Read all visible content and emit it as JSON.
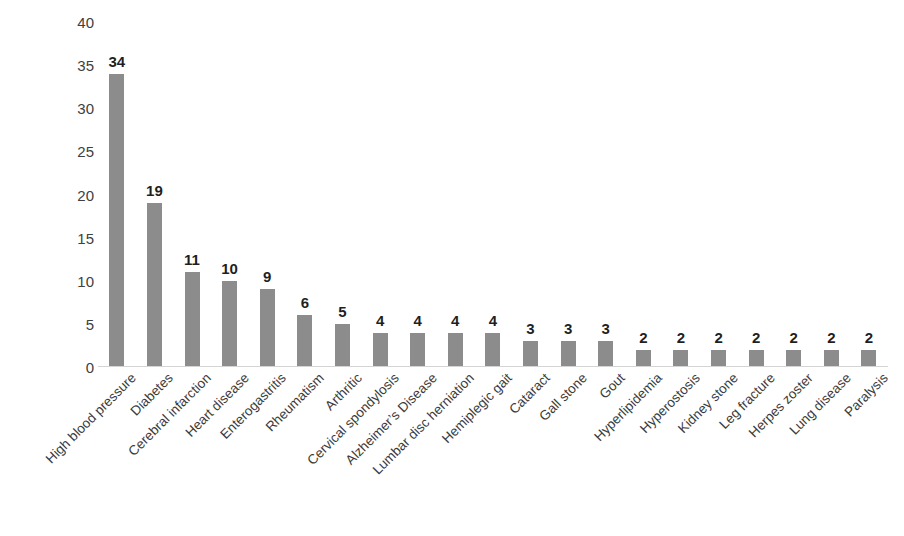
{
  "chart_data": {
    "type": "bar",
    "title": "",
    "subtitle": "",
    "xlabel": "",
    "ylabel": "Number of suffer ng elderly people",
    "ylim": [
      0,
      40
    ],
    "ytick_step": 5,
    "yticks": [
      "0",
      "5",
      "10",
      "15",
      "20",
      "25",
      "30",
      "35",
      "40"
    ],
    "grid": false,
    "legend": false,
    "legend_position": "none",
    "bar_color": "#8c8c8c",
    "show_value_labels": true,
    "categories": [
      "High blood pressure",
      "Diabetes",
      "Cerebral infarction",
      "Heart disease",
      "Enterogastritis",
      "Rheumatism",
      "Arthritic",
      "Cervical spondylosis",
      "Alzheimer’s Disease",
      "Lumbar disc herniation",
      "Hemiplegic gait",
      "Cataract",
      "Gall stone",
      "Gout",
      "Hyperlipidemia",
      "Hyperostosis",
      "Kidney stone",
      "Leg fracture",
      "Herpes zoster",
      "Lung disease",
      "Paralysis"
    ],
    "values": [
      34,
      19,
      11,
      10,
      9,
      6,
      5,
      4,
      4,
      4,
      4,
      3,
      3,
      3,
      2,
      2,
      2,
      2,
      2,
      2,
      2
    ],
    "value_labels": [
      "34",
      "19",
      "11",
      "10",
      "9",
      "6",
      "5",
      "4",
      "4",
      "4",
      "4",
      "3",
      "3",
      "3",
      "2",
      "2",
      "2",
      "2",
      "2",
      "2",
      "2"
    ]
  },
  "colors": {
    "bar": "#8c8c8c",
    "axis_line": "#d4d4d4",
    "text": "#2b2b2b",
    "background": "#ffffff"
  }
}
